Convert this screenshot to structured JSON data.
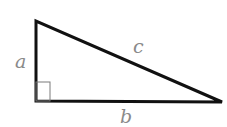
{
  "diagram": {
    "type": "right-triangle",
    "vertices": {
      "top": [
        36,
        21
      ],
      "right_angle": [
        36,
        101
      ],
      "far": [
        222,
        102
      ]
    },
    "labels": {
      "a": "a",
      "b": "b",
      "c": "c"
    },
    "right_angle_marker": true,
    "colors": {
      "stroke": "#111111",
      "label": "#8a8a8a",
      "marker": "#7a7a7a"
    }
  }
}
